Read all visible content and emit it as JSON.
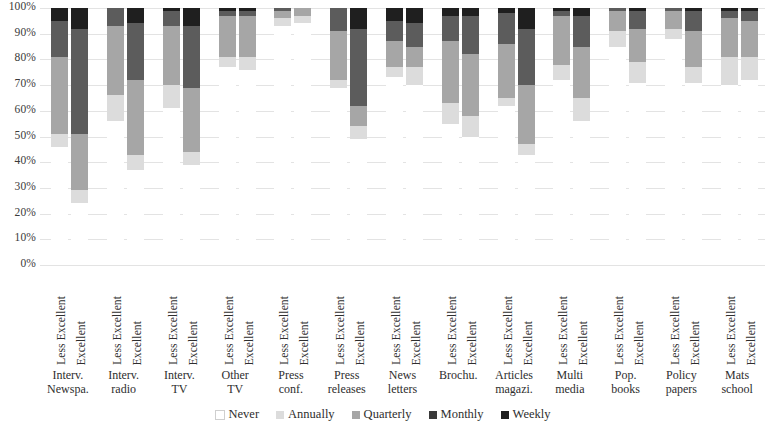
{
  "chart_data": {
    "type": "bar",
    "title": "",
    "xlabel": "",
    "ylabel": "",
    "stacked": true,
    "orientation": "vertical",
    "ylim": [
      0,
      100
    ],
    "ytick_labels": [
      "100%",
      "90%",
      "80%",
      "70%",
      "60%",
      "50%",
      "40%",
      "30%",
      "20%",
      "10%",
      "0%"
    ],
    "ytick_values": [
      100,
      90,
      80,
      70,
      60,
      50,
      40,
      30,
      20,
      10,
      0
    ],
    "grid": true,
    "legend_position": "bottom",
    "series_order_bottom_to_top": [
      "Never",
      "Annually",
      "Quarterly",
      "Monthly",
      "Weekly"
    ],
    "series_colors": {
      "Never": "#ffffff",
      "Annually": "#dcdcdc",
      "Quarterly": "#a6a6a6",
      "Monthly": "#5c5c5c",
      "Weekly": "#1f1f1f"
    },
    "legend": [
      {
        "label": "Never",
        "color": "#ffffff"
      },
      {
        "label": "Annually",
        "color": "#dcdcdc"
      },
      {
        "label": "Quarterly",
        "color": "#a6a6a6"
      },
      {
        "label": "Monthly",
        "color": "#3a3a3a"
      },
      {
        "label": "Weekly",
        "color": "#1f1f1f"
      }
    ],
    "bar_labels": [
      "Less Excellent",
      "Excellent"
    ],
    "categories": [
      "Interv. Newspa.",
      "Interv. radio",
      "Interv. TV",
      "Other TV",
      "Press conf.",
      "Press releases",
      "News letters",
      "Brochu.",
      "Articles magazi.",
      "Multi media",
      "Pop. books",
      "Policy papers",
      "Mats school"
    ],
    "category_lines": [
      [
        "Interv.",
        "Newspa."
      ],
      [
        "Interv.",
        "radio"
      ],
      [
        "Interv.",
        "TV"
      ],
      [
        "Other",
        "TV"
      ],
      [
        "Press",
        "conf."
      ],
      [
        "Press",
        "releases"
      ],
      [
        "News",
        "letters"
      ],
      [
        "Brochu.",
        ""
      ],
      [
        "Articles",
        "magazi."
      ],
      [
        "Multi",
        "media"
      ],
      [
        "Pop.",
        "books"
      ],
      [
        "Policy",
        "papers"
      ],
      [
        "Mats",
        "school"
      ]
    ],
    "groups": [
      {
        "category": "Interv. Newspa.",
        "bars": [
          {
            "label": "Less Excellent",
            "values": {
              "Never": 46,
              "Annually": 5,
              "Quarterly": 30,
              "Monthly": 14,
              "Weekly": 5
            }
          },
          {
            "label": "Excellent",
            "values": {
              "Never": 24,
              "Annually": 5,
              "Quarterly": 22,
              "Monthly": 41,
              "Weekly": 8
            }
          }
        ]
      },
      {
        "category": "Interv. radio",
        "bars": [
          {
            "label": "Less Excellent",
            "values": {
              "Never": 56,
              "Annually": 10,
              "Quarterly": 27,
              "Monthly": 7,
              "Weekly": 0
            }
          },
          {
            "label": "Excellent",
            "values": {
              "Never": 37,
              "Annually": 6,
              "Quarterly": 29,
              "Monthly": 22,
              "Weekly": 6
            }
          }
        ]
      },
      {
        "category": "Interv. TV",
        "bars": [
          {
            "label": "Less Excellent",
            "values": {
              "Never": 61,
              "Annually": 9,
              "Quarterly": 23,
              "Monthly": 6,
              "Weekly": 1
            }
          },
          {
            "label": "Excellent",
            "values": {
              "Never": 39,
              "Annually": 5,
              "Quarterly": 25,
              "Monthly": 24,
              "Weekly": 7
            }
          }
        ]
      },
      {
        "category": "Other TV",
        "bars": [
          {
            "label": "Less Excellent",
            "values": {
              "Never": 77,
              "Annually": 4,
              "Quarterly": 16,
              "Monthly": 2,
              "Weekly": 1
            }
          },
          {
            "label": "Excellent",
            "values": {
              "Never": 76,
              "Annually": 5,
              "Quarterly": 16,
              "Monthly": 2,
              "Weekly": 1
            }
          }
        ]
      },
      {
        "category": "Press conf.",
        "bars": [
          {
            "label": "Less Excellent",
            "values": {
              "Never": 93,
              "Annually": 3,
              "Quarterly": 3,
              "Monthly": 1,
              "Weekly": 0
            }
          },
          {
            "label": "Excellent",
            "values": {
              "Never": 94,
              "Annually": 3,
              "Quarterly": 3,
              "Monthly": 0,
              "Weekly": 0
            }
          }
        ]
      },
      {
        "category": "Press releases",
        "bars": [
          {
            "label": "Less Excellent",
            "values": {
              "Never": 69,
              "Annually": 3,
              "Quarterly": 19,
              "Monthly": 9,
              "Weekly": 0
            }
          },
          {
            "label": "Excellent",
            "values": {
              "Never": 49,
              "Annually": 5,
              "Quarterly": 8,
              "Monthly": 30,
              "Weekly": 8
            }
          }
        ]
      },
      {
        "category": "News letters",
        "bars": [
          {
            "label": "Less Excellent",
            "values": {
              "Never": 73,
              "Annually": 4,
              "Quarterly": 10,
              "Monthly": 8,
              "Weekly": 5
            }
          },
          {
            "label": "Excellent",
            "values": {
              "Never": 70,
              "Annually": 7,
              "Quarterly": 8,
              "Monthly": 9,
              "Weekly": 6
            }
          }
        ]
      },
      {
        "category": "Brochu.",
        "bars": [
          {
            "label": "Less Excellent",
            "values": {
              "Never": 55,
              "Annually": 8,
              "Quarterly": 24,
              "Monthly": 10,
              "Weekly": 3
            }
          },
          {
            "label": "Excellent",
            "values": {
              "Never": 50,
              "Annually": 8,
              "Quarterly": 24,
              "Monthly": 15,
              "Weekly": 3
            }
          }
        ]
      },
      {
        "category": "Articles magazi.",
        "bars": [
          {
            "label": "Less Excellent",
            "values": {
              "Never": 62,
              "Annually": 3,
              "Quarterly": 21,
              "Monthly": 12,
              "Weekly": 2
            }
          },
          {
            "label": "Excellent",
            "values": {
              "Never": 43,
              "Annually": 4,
              "Quarterly": 23,
              "Monthly": 22,
              "Weekly": 8
            }
          }
        ]
      },
      {
        "category": "Multi media",
        "bars": [
          {
            "label": "Less Excellent",
            "values": {
              "Never": 72,
              "Annually": 6,
              "Quarterly": 19,
              "Monthly": 2,
              "Weekly": 1
            }
          },
          {
            "label": "Excellent",
            "values": {
              "Never": 56,
              "Annually": 9,
              "Quarterly": 20,
              "Monthly": 12,
              "Weekly": 3
            }
          }
        ]
      },
      {
        "category": "Pop. books",
        "bars": [
          {
            "label": "Less Excellent",
            "values": {
              "Never": 85,
              "Annually": 6,
              "Quarterly": 8,
              "Monthly": 1,
              "Weekly": 0
            }
          },
          {
            "label": "Excellent",
            "values": {
              "Never": 71,
              "Annually": 8,
              "Quarterly": 13,
              "Monthly": 7,
              "Weekly": 1
            }
          }
        ]
      },
      {
        "category": "Policy papers",
        "bars": [
          {
            "label": "Less Excellent",
            "values": {
              "Never": 88,
              "Annually": 4,
              "Quarterly": 7,
              "Monthly": 1,
              "Weekly": 0
            }
          },
          {
            "label": "Excellent",
            "values": {
              "Never": 71,
              "Annually": 6,
              "Quarterly": 14,
              "Monthly": 8,
              "Weekly": 1
            }
          }
        ]
      },
      {
        "category": "Mats school",
        "bars": [
          {
            "label": "Less Excellent",
            "values": {
              "Never": 70,
              "Annually": 11,
              "Quarterly": 15,
              "Monthly": 3,
              "Weekly": 1
            }
          },
          {
            "label": "Excellent",
            "values": {
              "Never": 72,
              "Annually": 9,
              "Quarterly": 14,
              "Monthly": 4,
              "Weekly": 1
            }
          }
        ]
      }
    ]
  }
}
